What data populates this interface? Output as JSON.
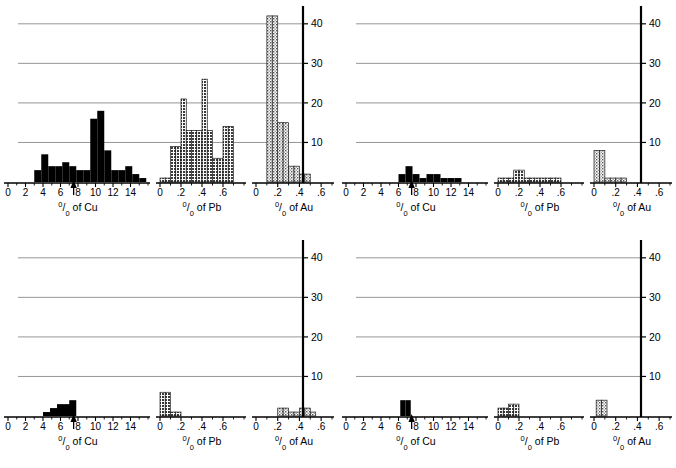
{
  "figure": {
    "panel_count": 4,
    "colors": {
      "cu_fill": "#000000",
      "pb_fill": "#6f6f6f",
      "au_fill": "#c9c9c9",
      "axis": "#000000",
      "gridline": "#8a8a8a",
      "background": "#ffffff"
    },
    "axis_titles": {
      "cu": "of Cu",
      "pb": "of Pb",
      "au": "of Au",
      "percent_num": "0",
      "percent_slash": "/",
      "percent_den": "0"
    },
    "y_axis": {
      "ticks": [
        10,
        20,
        30,
        40
      ],
      "tick_labels": [
        "10",
        "20",
        "30",
        "40"
      ],
      "min": 0,
      "max": 44,
      "gridlines": true
    },
    "cu_axis": {
      "ticks": [
        0,
        2,
        4,
        6,
        8,
        10,
        12,
        14
      ],
      "tick_labels": [
        "0",
        "2",
        "4",
        "6",
        "8",
        "10",
        "12",
        "14"
      ],
      "min": 0,
      "max": 16,
      "marker_value": 7.5
    },
    "pb_axis": {
      "ticks": [
        0,
        0.2,
        0.4,
        0.6
      ],
      "tick_labels": [
        "0",
        ".2",
        ".4",
        ".6"
      ],
      "min": 0,
      "max": 0.8
    },
    "au_axis": {
      "ticks": [
        0,
        0.2,
        0.4,
        0.6
      ],
      "tick_labels": [
        "0",
        ".2",
        ".4",
        ".6"
      ],
      "min": 0,
      "max": 0.7
    }
  },
  "chart_data": [
    {
      "panel": "top-left",
      "type": "bar",
      "title": "",
      "ylabel": "",
      "ylim": [
        0,
        44
      ],
      "series": [
        {
          "name": "% of Cu",
          "xlabel": "0/0 of Cu",
          "fill": "#000000",
          "bin_width": 0.8,
          "bins": [
            3.0,
            3.8,
            4.6,
            5.4,
            6.2,
            7.0,
            7.8,
            8.6,
            9.4,
            10.2,
            11.0,
            11.8,
            12.6,
            13.4,
            14.2,
            15.0
          ],
          "values": [
            3,
            7,
            4,
            4,
            5,
            4,
            3,
            3,
            16,
            18,
            8,
            3,
            3,
            4,
            2,
            1
          ]
        },
        {
          "name": "% of Pb",
          "xlabel": "0/0 of Pb",
          "fill": "#6f6f6f",
          "bin_width": 0.05,
          "bins": [
            0.0,
            0.05,
            0.1,
            0.15,
            0.2,
            0.25,
            0.3,
            0.35,
            0.4,
            0.45,
            0.5,
            0.55,
            0.6,
            0.65
          ],
          "values": [
            1,
            1,
            9,
            9,
            21,
            13,
            13,
            13,
            26,
            13,
            6,
            6,
            14,
            14
          ]
        },
        {
          "name": "% of Au",
          "xlabel": "0/0 of Au",
          "fill": "#c9c9c9",
          "bin_width": 0.05,
          "bins": [
            0.1,
            0.15,
            0.2,
            0.25,
            0.3,
            0.35,
            0.4,
            0.45,
            0.5
          ],
          "values": [
            42,
            42,
            15,
            15,
            4,
            4,
            2,
            2,
            0
          ]
        }
      ]
    },
    {
      "panel": "top-right",
      "type": "bar",
      "title": "",
      "ylabel": "",
      "ylim": [
        0,
        44
      ],
      "series": [
        {
          "name": "% of Cu",
          "xlabel": "0/0 of Cu",
          "fill": "#000000",
          "bin_width": 0.8,
          "bins": [
            6.0,
            6.8,
            7.6,
            8.4,
            9.2,
            10.0,
            10.8,
            11.6,
            12.4
          ],
          "values": [
            2,
            4,
            2,
            1,
            2,
            2,
            1,
            1,
            1
          ]
        },
        {
          "name": "% of Pb",
          "xlabel": "0/0 of Pb",
          "fill": "#6f6f6f",
          "bin_width": 0.05,
          "bins": [
            0.0,
            0.05,
            0.1,
            0.15,
            0.2,
            0.25,
            0.3,
            0.35,
            0.4,
            0.45,
            0.5,
            0.55
          ],
          "values": [
            1,
            1,
            1,
            3,
            3,
            1,
            1,
            1,
            1,
            1,
            1,
            1
          ]
        },
        {
          "name": "% of Au",
          "xlabel": "0/0 of Au",
          "fill": "#c9c9c9",
          "bin_width": 0.05,
          "bins": [
            0.0,
            0.05,
            0.1,
            0.15,
            0.2,
            0.25
          ],
          "values": [
            8,
            8,
            1,
            1,
            1,
            1
          ]
        }
      ]
    },
    {
      "panel": "bottom-left",
      "type": "bar",
      "title": "",
      "ylabel": "",
      "ylim": [
        0,
        44
      ],
      "series": [
        {
          "name": "% of Cu",
          "xlabel": "0/0 of Cu",
          "fill": "#000000",
          "bin_width": 0.8,
          "bins": [
            4.0,
            4.8,
            5.6,
            6.4,
            7.0
          ],
          "values": [
            1,
            2,
            3,
            3,
            4
          ]
        },
        {
          "name": "% of Pb",
          "xlabel": "0/0 of Pb",
          "fill": "#6f6f6f",
          "bin_width": 0.05,
          "bins": [
            0.0,
            0.05,
            0.1,
            0.15
          ],
          "values": [
            6,
            6,
            1,
            1
          ]
        },
        {
          "name": "% of Au",
          "xlabel": "0/0 of Au",
          "fill": "#c9c9c9",
          "bin_width": 0.05,
          "bins": [
            0.2,
            0.25,
            0.3,
            0.35,
            0.4,
            0.45,
            0.5
          ],
          "values": [
            2,
            2,
            1,
            1,
            2,
            2,
            1
          ]
        }
      ]
    },
    {
      "panel": "bottom-right",
      "type": "bar",
      "title": "",
      "ylabel": "",
      "ylim": [
        0,
        44
      ],
      "series": [
        {
          "name": "% of Cu",
          "xlabel": "0/0 of Cu",
          "fill": "#000000",
          "bin_width": 0.6,
          "bins": [
            6.2,
            6.8
          ],
          "values": [
            4,
            4
          ]
        },
        {
          "name": "% of Pb",
          "xlabel": "0/0 of Pb",
          "fill": "#6f6f6f",
          "bin_width": 0.05,
          "bins": [
            0.0,
            0.05,
            0.1,
            0.15
          ],
          "values": [
            2,
            2,
            3,
            3
          ]
        },
        {
          "name": "% of Au",
          "xlabel": "0/0 of Au",
          "fill": "#c9c9c9",
          "bin_width": 0.05,
          "bins": [
            0.02,
            0.07
          ],
          "values": [
            4,
            4
          ]
        }
      ]
    }
  ]
}
